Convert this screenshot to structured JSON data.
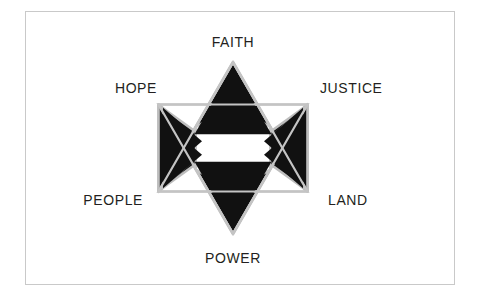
{
  "figure": {
    "type": "hexagram-diagram",
    "name": "Star of David concept diagram",
    "background_color": "#ffffff",
    "frame": {
      "name": "image-frame",
      "border_color": "#c9c9c9",
      "border_width": 1
    },
    "star": {
      "name": "star-of-david",
      "fill_color": "#111111",
      "outline_color": "#b8b8b8",
      "gap_color": "#ffffff",
      "center_x": 233,
      "center_y": 148,
      "outer_radius": 86,
      "inner_radius": 43,
      "point_count": 6,
      "center_shape": "hollow-hexagon"
    },
    "labels": [
      {
        "id": "faith",
        "text": "FAITH",
        "position": "top"
      },
      {
        "id": "hope",
        "text": "HOPE",
        "position": "upper-left"
      },
      {
        "id": "justice",
        "text": "JUSTICE",
        "position": "upper-right"
      },
      {
        "id": "people",
        "text": "PEOPLE",
        "position": "lower-left"
      },
      {
        "id": "land",
        "text": "LAND",
        "position": "lower-right"
      },
      {
        "id": "power",
        "text": "POWER",
        "position": "bottom"
      }
    ],
    "text_color": "#231f20"
  }
}
